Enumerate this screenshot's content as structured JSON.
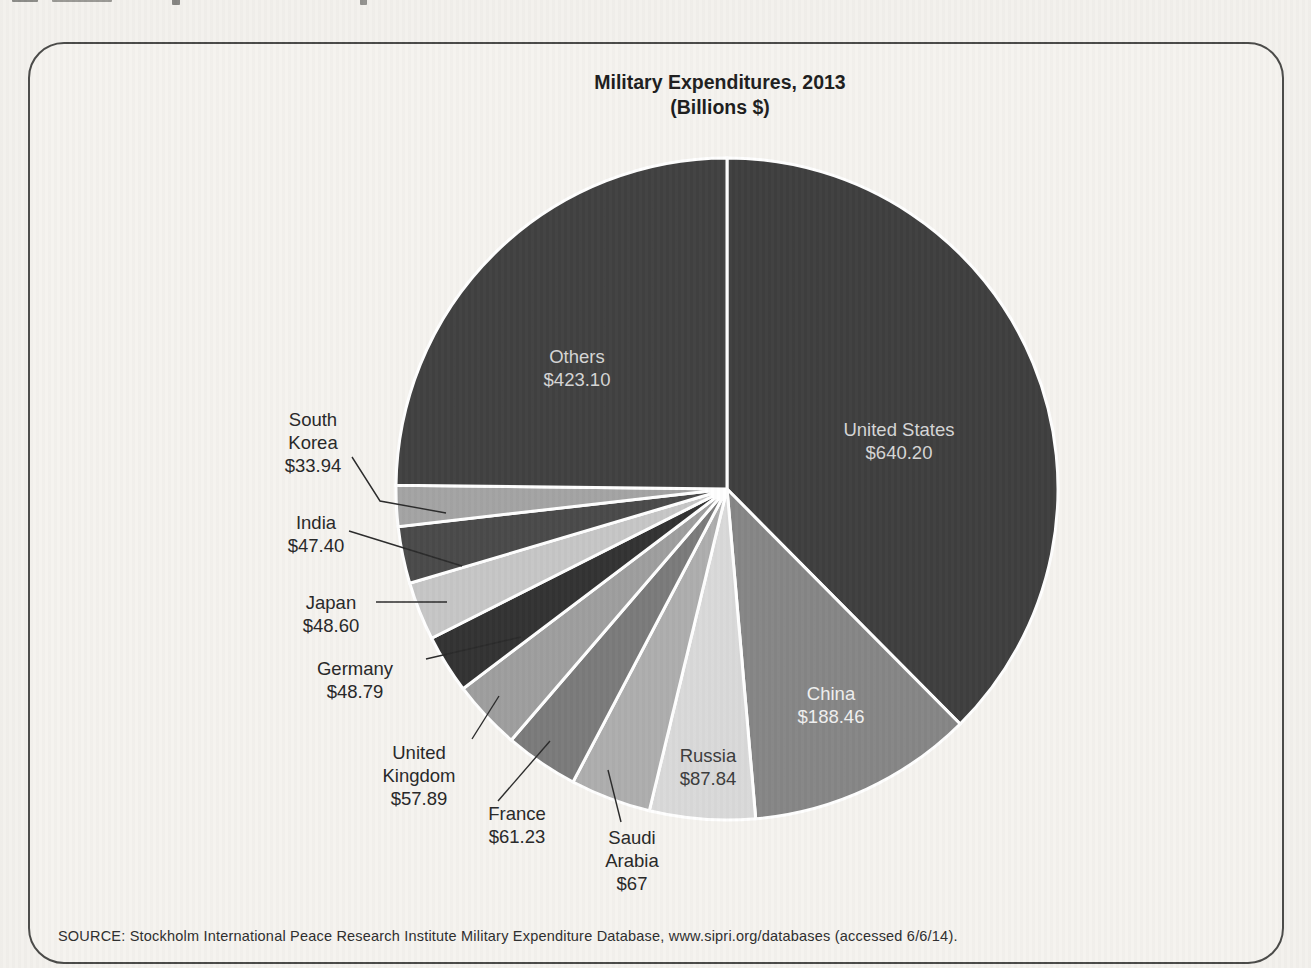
{
  "page": {
    "background_color": "#f3f1ed",
    "frame_border_color": "#4a4a48"
  },
  "figure": {
    "title": "Military Expenditures, 2013",
    "subtitle": "(Billions $)",
    "source_note": "SOURCE: Stockholm International Peace Research Institute Military Expenditure Database, www.sipri.org/databases (accessed 6/6/14)."
  },
  "chart_data": {
    "type": "pie",
    "title": "Military Expenditures, 2013",
    "subtitle": "(Billions $)",
    "unit": "Billions $",
    "direction": "clockwise",
    "start_angle_deg": 0,
    "separator_color": "#ffffff",
    "leader_line_color": "#2b2b2b",
    "outside_label_color": "#282828",
    "geometry": {
      "cx": 727,
      "cy": 489,
      "r": 331
    },
    "slices": [
      {
        "name": "United States",
        "value": 640.2,
        "display_value": "$640.20",
        "color": "#3f3f3f",
        "label_placement": "inside",
        "label_color": "#d6d6d6",
        "label_lines": [
          "United States",
          "$640.20"
        ],
        "label_pos": {
          "x": 899,
          "y": 441
        }
      },
      {
        "name": "China",
        "value": 188.46,
        "display_value": "$188.46",
        "color": "#868686",
        "label_placement": "inside",
        "label_color": "#f0f0f0",
        "label_lines": [
          "China",
          "$188.46"
        ],
        "label_pos": {
          "x": 831,
          "y": 705
        }
      },
      {
        "name": "Russia",
        "value": 87.84,
        "display_value": "$87.84",
        "color": "#d9d9d9",
        "label_placement": "inside",
        "label_color": "#3c3c3c",
        "label_lines": [
          "Russia",
          "$87.84"
        ],
        "label_pos": {
          "x": 708,
          "y": 767
        }
      },
      {
        "name": "Saudi Arabia",
        "value": 67,
        "display_value": "$67",
        "color": "#aeaeae",
        "label_placement": "outside",
        "label_lines": [
          "Saudi",
          "Arabia",
          "$67"
        ],
        "label_pos": {
          "x": 632,
          "y": 860
        },
        "leader": [
          [
            621,
            822
          ],
          [
            608,
            770
          ]
        ]
      },
      {
        "name": "France",
        "value": 61.23,
        "display_value": "$61.23",
        "color": "#7b7b7b",
        "label_placement": "outside",
        "label_lines": [
          "France",
          "$61.23"
        ],
        "label_pos": {
          "x": 517,
          "y": 825
        },
        "leader": [
          [
            498,
            801
          ],
          [
            550,
            741
          ]
        ]
      },
      {
        "name": "United Kingdom",
        "value": 57.89,
        "display_value": "$57.89",
        "color": "#9e9e9e",
        "label_placement": "outside",
        "label_lines": [
          "United",
          "Kingdom",
          "$57.89"
        ],
        "label_pos": {
          "x": 419,
          "y": 775
        },
        "leader": [
          [
            472,
            739
          ],
          [
            499,
            696
          ]
        ]
      },
      {
        "name": "Germany",
        "value": 48.79,
        "display_value": "$48.79",
        "color": "#333333",
        "label_placement": "outside",
        "label_lines": [
          "Germany",
          "$48.79"
        ],
        "label_pos": {
          "x": 355,
          "y": 680
        },
        "leader": [
          [
            426,
            659
          ],
          [
            521,
            637
          ]
        ]
      },
      {
        "name": "Japan",
        "value": 48.6,
        "display_value": "$48.60",
        "color": "#c6c6c6",
        "label_placement": "outside",
        "label_lines": [
          "Japan",
          "$48.60"
        ],
        "label_pos": {
          "x": 331,
          "y": 614
        },
        "leader": [
          [
            376,
            602
          ],
          [
            447,
            602
          ]
        ]
      },
      {
        "name": "India",
        "value": 47.4,
        "display_value": "$47.40",
        "color": "#4a4a4a",
        "label_placement": "outside",
        "label_lines": [
          "India",
          "$47.40"
        ],
        "label_pos": {
          "x": 316,
          "y": 534
        },
        "leader": [
          [
            349,
            531
          ],
          [
            462,
            566
          ]
        ]
      },
      {
        "name": "South Korea",
        "value": 33.94,
        "display_value": "$33.94",
        "color": "#a4a4a4",
        "label_placement": "outside",
        "label_lines": [
          "South",
          "Korea",
          "$33.94"
        ],
        "label_pos": {
          "x": 313,
          "y": 442
        },
        "leader": [
          [
            352,
            457
          ],
          [
            380,
            501
          ],
          [
            446,
            513
          ]
        ]
      },
      {
        "name": "Others",
        "value": 423.1,
        "display_value": "$423.10",
        "color": "#414141",
        "label_placement": "inside",
        "label_color": "#d6d6d6",
        "label_lines": [
          "Others",
          "$423.10"
        ],
        "label_pos": {
          "x": 577,
          "y": 368
        }
      }
    ]
  }
}
